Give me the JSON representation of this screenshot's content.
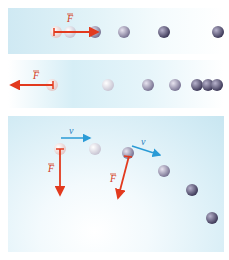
{
  "figure": {
    "panels": [
      {
        "id": "speeding-up",
        "force_label": "F",
        "force_direction": "right",
        "balls_x": [
          56,
          70,
          95,
          124,
          164,
          219
        ],
        "balls_y": 30
      },
      {
        "id": "slowing-down",
        "force_label": "F",
        "force_direction": "left",
        "balls_x": [
          52,
          108,
          148,
          175,
          200,
          210,
          217
        ],
        "balls_y": 85
      },
      {
        "id": "changing-direction",
        "velocity_label": "v",
        "force_label": "F",
        "left_pair": {
          "ball1": [
            60,
            149
          ],
          "ball2": [
            95,
            148
          ]
        },
        "right_sequence": [
          [
            128,
            153
          ],
          [
            164,
            171
          ],
          [
            192,
            189
          ],
          [
            212,
            218
          ]
        ]
      }
    ],
    "colors": {
      "force_arrow": "#e23a1e",
      "velocity_arrow": "#2a9bd6",
      "ball_light": "#eeeef2",
      "ball_dark": "#4e4a6a",
      "label_red": "#d43a20",
      "label_blue": "#2a7fc0"
    }
  }
}
